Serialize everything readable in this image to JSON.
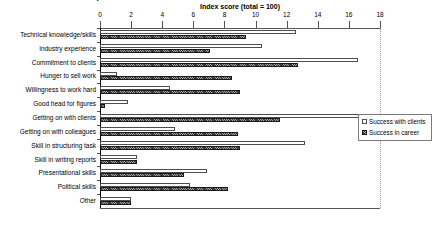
{
  "chart_data": {
    "type": "bar",
    "orientation": "horizontal",
    "title": "Importance of attributes for success with clients and success in career",
    "xlabel": "Index score (total = 100)",
    "ylabel": "",
    "xlim": [
      0,
      18
    ],
    "xticks": [
      0,
      2,
      4,
      6,
      8,
      10,
      12,
      14,
      16,
      18
    ],
    "grid": false,
    "legend_position": "right",
    "categories": [
      "Technical knowledge/skills",
      "Industry experience",
      "Commitment to clients",
      "Hunger to sell work",
      "Willingness to work hard",
      "Good head for figures",
      "Getting on with clients",
      "Getting on with colleagues",
      "Skill in structuring task",
      "Skill in writing reports",
      "Presentational skills",
      "Political skills",
      "Other"
    ],
    "series": [
      {
        "name": "Success with clients",
        "style": "hollow",
        "color": "#ffffff",
        "values": [
          12.6,
          10.4,
          16.6,
          1.1,
          4.5,
          1.8,
          16.7,
          4.8,
          13.2,
          2.4,
          6.9,
          5.8,
          2.0
        ]
      },
      {
        "name": "Success in career",
        "style": "hatched",
        "color": "#3a3a3a",
        "values": [
          9.4,
          7.1,
          12.7,
          8.5,
          9.0,
          0.3,
          11.6,
          8.9,
          9.0,
          2.4,
          5.4,
          8.2,
          2.0
        ]
      }
    ]
  },
  "axis": {
    "title": "Index score (total = 100)"
  },
  "legend": {
    "entries": [
      {
        "label": "Success with clients"
      },
      {
        "label": "Success in career"
      }
    ]
  }
}
